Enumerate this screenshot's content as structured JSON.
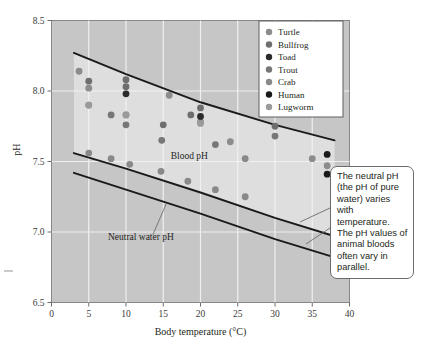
{
  "chart_data": {
    "type": "scatter",
    "title": "",
    "xlabel": "Body temperature (°C)",
    "ylabel": "pH",
    "xlim": [
      0,
      40
    ],
    "ylim": [
      6.5,
      8.5
    ],
    "xticks": [
      0,
      5,
      10,
      15,
      20,
      25,
      30,
      35,
      40
    ],
    "xtick_labels": [
      "0",
      "5",
      "10",
      "15",
      "20",
      "25",
      "30",
      "35",
      "40"
    ],
    "yticks": [
      6.5,
      7.0,
      7.5,
      8.0,
      8.5
    ],
    "ytick_labels": [
      "6.5",
      "7.0",
      "7.5",
      "8.0",
      "8.5"
    ],
    "grid": "white gridlines on gray panel, vertical at every x tick, horizontal at every y tick",
    "legend_position": "top-right inside plot",
    "plot_annotations": [
      {
        "text": "Blood pH",
        "x": 18.5,
        "y": 7.52
      },
      {
        "text": "Neutral water pH",
        "x": 12.0,
        "y": 6.94
      }
    ],
    "series": [
      {
        "name": "Turtle",
        "color": "#8c8c8c",
        "points": [
          [
            3.7,
            8.14
          ],
          [
            5.0,
            8.02
          ],
          [
            10.0,
            7.83
          ],
          [
            15.8,
            7.97
          ],
          [
            20.0,
            7.78
          ],
          [
            24.0,
            7.64
          ],
          [
            35.0,
            7.52
          ],
          [
            37.0,
            7.47
          ]
        ]
      },
      {
        "name": "Bullfrog",
        "color": "#6e6e6e",
        "points": [
          [
            5.0,
            8.07
          ],
          [
            10.0,
            8.08
          ],
          [
            10.0,
            8.03
          ],
          [
            15.0,
            7.76
          ],
          [
            18.7,
            7.83
          ],
          [
            20.0,
            7.88
          ],
          [
            30.0,
            7.75
          ]
        ]
      },
      {
        "name": "Toad",
        "color": "#2b2b2b",
        "points": [
          [
            10.0,
            7.98
          ],
          [
            20.0,
            7.82
          ]
        ]
      },
      {
        "name": "Trout",
        "color": "#777777",
        "points": [
          [
            5.0,
            7.9
          ],
          [
            8.0,
            7.83
          ],
          [
            10.0,
            7.76
          ],
          [
            14.8,
            7.65
          ],
          [
            22.0,
            7.62
          ],
          [
            30.0,
            7.68
          ]
        ]
      },
      {
        "name": "Crab",
        "color": "#898989",
        "points": [
          [
            5.0,
            7.56
          ],
          [
            8.0,
            7.52
          ],
          [
            10.5,
            7.48
          ],
          [
            14.7,
            7.43
          ],
          [
            18.3,
            7.36
          ],
          [
            22.0,
            7.3
          ],
          [
            26.0,
            7.25
          ],
          [
            26.0,
            7.52
          ]
        ]
      },
      {
        "name": "Human",
        "color": "#1a1a1a",
        "points": [
          [
            37.0,
            7.55
          ],
          [
            37.0,
            7.41
          ]
        ]
      },
      {
        "name": "Lugworm",
        "color": "#9a9a9a",
        "points": [
          [
            5.0,
            7.9
          ],
          [
            10.0,
            7.83
          ],
          [
            20.0,
            7.77
          ]
        ]
      }
    ],
    "curves": [
      {
        "name": "Blood pH upper bound",
        "points": [
          [
            3.0,
            8.27
          ],
          [
            10.0,
            8.12
          ],
          [
            20.0,
            7.92
          ],
          [
            30.0,
            7.76
          ],
          [
            38.0,
            7.65
          ]
        ]
      },
      {
        "name": "Blood pH lower bound",
        "points": [
          [
            3.0,
            7.56
          ],
          [
            10.0,
            7.45
          ],
          [
            20.0,
            7.28
          ],
          [
            30.0,
            7.1
          ],
          [
            38.0,
            6.97
          ]
        ]
      },
      {
        "name": "Neutral water pH",
        "points": [
          [
            3.0,
            7.42
          ],
          [
            10.0,
            7.3
          ],
          [
            20.0,
            7.13
          ],
          [
            30.0,
            6.95
          ],
          [
            38.0,
            6.82
          ]
        ]
      }
    ]
  },
  "legend": {
    "items": [
      {
        "label": "Turtle",
        "color": "#8c8c8c"
      },
      {
        "label": "Bullfrog",
        "color": "#6e6e6e"
      },
      {
        "label": "Toad",
        "color": "#2b2b2b"
      },
      {
        "label": "Trout",
        "color": "#777777"
      },
      {
        "label": "Crab",
        "color": "#898989"
      },
      {
        "label": "Human",
        "color": "#1a1a1a"
      },
      {
        "label": "Lugworm",
        "color": "#9a9a9a"
      }
    ]
  },
  "callout": {
    "text": "The neutral pH (the pH of pure water) varies with temperature. The pH values of animal bloods often vary in parallel."
  },
  "colors": {
    "panel_background": "#c6c6c6",
    "band_background": "#dedede",
    "gridline": "#f2f2f2",
    "curve": "#1a1a1a",
    "axis_text": "#3a3a3a",
    "page_background": "#ffffff"
  },
  "axis": {
    "x_title": "Body temperature (°C)",
    "y_title": "pH"
  }
}
